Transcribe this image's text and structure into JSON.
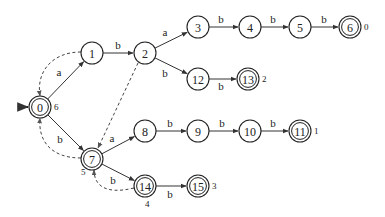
{
  "diagram": {
    "type": "automaton",
    "start_state": "0",
    "node_radius": 11,
    "nodes": [
      {
        "id": "0",
        "x": 40,
        "y": 107,
        "accepting": true,
        "output": "6",
        "ox": 11,
        "oy": 0
      },
      {
        "id": "1",
        "x": 92,
        "y": 53,
        "accepting": false
      },
      {
        "id": "2",
        "x": 145,
        "y": 53,
        "accepting": false
      },
      {
        "id": "3",
        "x": 198,
        "y": 27,
        "accepting": false
      },
      {
        "id": "4",
        "x": 250,
        "y": 27,
        "accepting": false
      },
      {
        "id": "5",
        "x": 300,
        "y": 27,
        "accepting": false
      },
      {
        "id": "6",
        "x": 350,
        "y": 27,
        "accepting": true,
        "output": "0",
        "ox": 11,
        "oy": 0
      },
      {
        "id": "12",
        "x": 198,
        "y": 79,
        "accepting": false
      },
      {
        "id": "13",
        "x": 248,
        "y": 79,
        "accepting": true,
        "output": "2",
        "ox": 11,
        "oy": 0
      },
      {
        "id": "7",
        "x": 92,
        "y": 159,
        "accepting": true,
        "output": "5",
        "ox": -14,
        "oy": 13
      },
      {
        "id": "8",
        "x": 145,
        "y": 131,
        "accepting": false
      },
      {
        "id": "9",
        "x": 198,
        "y": 131,
        "accepting": false
      },
      {
        "id": "10",
        "x": 250,
        "y": 131,
        "accepting": false
      },
      {
        "id": "11",
        "x": 300,
        "y": 131,
        "accepting": true,
        "output": "1",
        "ox": 11,
        "oy": 0
      },
      {
        "id": "14",
        "x": 145,
        "y": 186,
        "accepting": true,
        "output": "4",
        "ox": -3,
        "oy": 18
      },
      {
        "id": "15",
        "x": 198,
        "y": 186,
        "accepting": true,
        "output": "3",
        "ox": 11,
        "oy": 0
      }
    ],
    "edges": [
      {
        "from": "0",
        "to": "1",
        "label": "a",
        "lx": 59,
        "ly": 72
      },
      {
        "from": "1",
        "to": "2",
        "label": "b",
        "lx": 118,
        "ly": 45
      },
      {
        "from": "2",
        "to": "3",
        "label": "a",
        "lx": 165,
        "ly": 32
      },
      {
        "from": "2",
        "to": "12",
        "label": "b",
        "lx": 165,
        "ly": 73
      },
      {
        "from": "3",
        "to": "4",
        "label": "b",
        "lx": 221,
        "ly": 19
      },
      {
        "from": "4",
        "to": "5",
        "label": "b",
        "lx": 273,
        "ly": 19
      },
      {
        "from": "5",
        "to": "6",
        "label": "b",
        "lx": 324,
        "ly": 19
      },
      {
        "from": "12",
        "to": "13",
        "label": "b",
        "lx": 221,
        "ly": 86
      },
      {
        "from": "0",
        "to": "7",
        "label": "b",
        "lx": 60,
        "ly": 139
      },
      {
        "from": "7",
        "to": "8",
        "label": "a",
        "lx": 112,
        "ly": 138
      },
      {
        "from": "8",
        "to": "9",
        "label": "b",
        "lx": 170,
        "ly": 123
      },
      {
        "from": "9",
        "to": "10",
        "label": "b",
        "lx": 222,
        "ly": 123
      },
      {
        "from": "10",
        "to": "11",
        "label": "b",
        "lx": 273,
        "ly": 123
      },
      {
        "from": "7",
        "to": "14",
        "label": "b",
        "lx": 113,
        "ly": 180
      },
      {
        "from": "14",
        "to": "15",
        "label": "b",
        "lx": 170,
        "ly": 194
      }
    ],
    "failure_edges": [
      {
        "from": "1",
        "to": "0",
        "path": "M81,52 C52,52 36,72 40,96"
      },
      {
        "from": "2",
        "to": "7",
        "path": "M138,63 L98,148"
      },
      {
        "from": "7",
        "to": "0",
        "path": "M81,158 C50,158 38,140 40,118"
      },
      {
        "from": "14",
        "to": "7",
        "path": "M134,188 C105,195 94,185 94,170"
      }
    ],
    "start_arrow": {
      "x1": 18,
      "y1": 107,
      "x2": 28,
      "y2": 107
    }
  }
}
